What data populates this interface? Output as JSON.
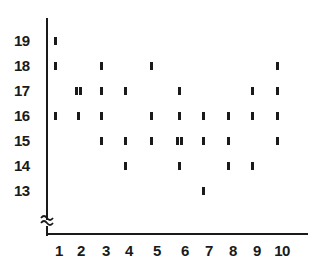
{
  "chart_data": {
    "type": "scatter",
    "subtype": "dot-tally",
    "title": "",
    "xlabel": "",
    "ylabel": "",
    "x_ticks": [
      "1",
      "2",
      "3",
      "4",
      "5",
      "6",
      "7",
      "8",
      "9",
      "10"
    ],
    "y_ticks": [
      "19",
      "18",
      "17",
      "16",
      "15",
      "14",
      "13"
    ],
    "xlim": [
      1,
      10
    ],
    "ylim": [
      13,
      19
    ],
    "y_axis_break": true,
    "grid": false,
    "legend": null,
    "mark_color": "#1a1a1a",
    "points": [
      {
        "x": 1,
        "y": 19,
        "count": 1
      },
      {
        "x": 1,
        "y": 18,
        "count": 1
      },
      {
        "x": 1,
        "y": 16,
        "count": 1
      },
      {
        "x": 2,
        "y": 17,
        "count": 2
      },
      {
        "x": 2,
        "y": 16,
        "count": 1
      },
      {
        "x": 3,
        "y": 18,
        "count": 1
      },
      {
        "x": 3,
        "y": 17,
        "count": 1
      },
      {
        "x": 3,
        "y": 16,
        "count": 1
      },
      {
        "x": 3,
        "y": 15,
        "count": 1
      },
      {
        "x": 4,
        "y": 17,
        "count": 1
      },
      {
        "x": 4,
        "y": 15,
        "count": 1
      },
      {
        "x": 4,
        "y": 14,
        "count": 1
      },
      {
        "x": 5,
        "y": 18,
        "count": 1
      },
      {
        "x": 5,
        "y": 16,
        "count": 1
      },
      {
        "x": 5,
        "y": 15,
        "count": 1
      },
      {
        "x": 6,
        "y": 17,
        "count": 1
      },
      {
        "x": 6,
        "y": 16,
        "count": 1
      },
      {
        "x": 6,
        "y": 15,
        "count": 2
      },
      {
        "x": 6,
        "y": 14,
        "count": 1
      },
      {
        "x": 7,
        "y": 16,
        "count": 1
      },
      {
        "x": 7,
        "y": 15,
        "count": 1
      },
      {
        "x": 7,
        "y": 13,
        "count": 1
      },
      {
        "x": 8,
        "y": 16,
        "count": 1
      },
      {
        "x": 8,
        "y": 15,
        "count": 1
      },
      {
        "x": 8,
        "y": 14,
        "count": 1
      },
      {
        "x": 9,
        "y": 17,
        "count": 1
      },
      {
        "x": 9,
        "y": 16,
        "count": 1
      },
      {
        "x": 9,
        "y": 14,
        "count": 1
      },
      {
        "x": 10,
        "y": 18,
        "count": 1
      },
      {
        "x": 10,
        "y": 17,
        "count": 1
      },
      {
        "x": 10,
        "y": 16,
        "count": 1
      },
      {
        "x": 10,
        "y": 15,
        "count": 1
      }
    ]
  },
  "layout": {
    "x_label_px": {
      "1": 59,
      "2": 81,
      "3": 106,
      "4": 129,
      "5": 157,
      "6": 185,
      "7": 209,
      "8": 233,
      "9": 257,
      "10": 282
    },
    "x_mark_px": {
      "1": 55,
      "2": 78,
      "3": 101,
      "4": 125,
      "5": 151,
      "6": 179,
      "7": 203,
      "8": 228,
      "9": 252,
      "10": 277
    },
    "y_px": {
      "19": 41,
      "18": 66,
      "17": 91,
      "16": 116,
      "15": 141,
      "14": 166,
      "13": 191
    }
  }
}
